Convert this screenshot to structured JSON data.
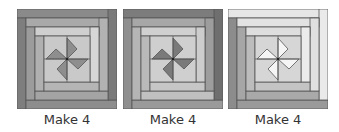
{
  "blocks": [
    {
      "caption": "Make 4",
      "logs": {
        "outer_top": "#8a8a8a",
        "outer_left": "#7e7e7e",
        "outer_bottom": "#8d8d8d",
        "outer_right": "#7a7a7a",
        "mid_top": "#a9a9a9",
        "mid_left": "#9c9c9c",
        "mid_bottom": "#a4a4a4",
        "mid_right": "#b2b2b2",
        "inner_top": "#cfcfcf",
        "inner_left": "#b0b0b0",
        "inner_bottom": "#b5b5b5",
        "inner_right": "#d6d6d6",
        "center_bg": "#c9c9c9",
        "pinwheel": "#8e8e8e"
      }
    },
    {
      "caption": "Make 4",
      "logs": {
        "outer_top": "#7c7c7c",
        "outer_left": "#8f8f8f",
        "outer_bottom": "#9a9a9a",
        "outer_right": "#6f6f6f",
        "mid_top": "#a7a7a7",
        "mid_left": "#b5b5b5",
        "mid_bottom": "#c0c0c0",
        "mid_right": "#9d9d9d",
        "inner_top": "#d0d0d0",
        "inner_left": "#b9b9b9",
        "inner_bottom": "#c6c6c6",
        "inner_right": "#cdcdcd",
        "center_bg": "#cfcfcf",
        "pinwheel": "#7a7a7a"
      }
    },
    {
      "caption": "Make 4",
      "logs": {
        "outer_top": "#e6e6e6",
        "outer_left": "#8c8c8c",
        "outer_bottom": "#9a9a9a",
        "outer_right": "#eaeaea",
        "mid_top": "#e2e2e2",
        "mid_left": "#a6a6a6",
        "mid_bottom": "#a9a9a9",
        "mid_right": "#e0e0e0",
        "inner_top": "#dedede",
        "inner_left": "#bcbcbc",
        "inner_bottom": "#c4c4c4",
        "inner_right": "#ebebeb",
        "center_bg": "#d6d6d6",
        "pinwheel": "#f5f5f5"
      }
    }
  ]
}
